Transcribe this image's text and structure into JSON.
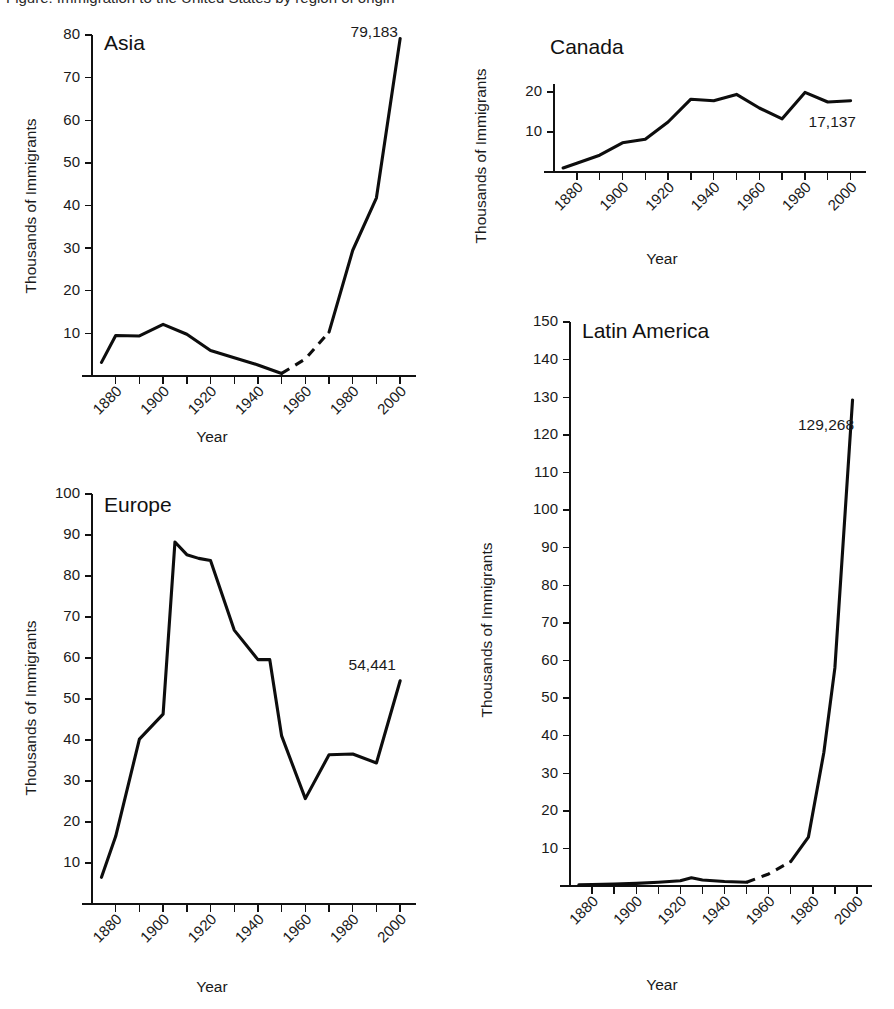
{
  "figure": {
    "background": "#ffffff",
    "line_color": "#0d0d0d",
    "axis_color": "#111111",
    "text_color": "#1a1a1a",
    "clipped_caption": "Figure: Immigration to the United States by region of origin"
  },
  "common": {
    "ylabel": "Thousands of Immigrants",
    "xlabel": "Year",
    "xtick_labels": [
      "1880",
      "1900",
      "1920",
      "1940",
      "1960",
      "1980",
      "2000"
    ]
  },
  "chart_data": [
    {
      "id": "asia",
      "type": "line",
      "title": "Asia",
      "xlabel": "Year",
      "ylabel": "Thousands of Immigrants",
      "xlim": [
        1870,
        2005
      ],
      "ylim": [
        0,
        80
      ],
      "yticks": [
        10,
        20,
        30,
        40,
        50,
        60,
        70,
        80
      ],
      "ytick_labels": [
        "10",
        "20",
        "30",
        "40",
        "50",
        "60",
        "70",
        "80"
      ],
      "xticks": [
        1880,
        1890,
        1900,
        1910,
        1920,
        1930,
        1940,
        1950,
        1960,
        1970,
        1980,
        1990,
        2000
      ],
      "xtick_labels": [
        "1880",
        "1900",
        "1920",
        "1940",
        "1960",
        "1980",
        "2000"
      ],
      "grid": false,
      "legend": "none",
      "endpoint_label": "79,183",
      "endpoint_year": 2000,
      "endpoint_value": 79.183,
      "solid_segments": [
        {
          "x": [
            1874,
            1880,
            1890,
            1900,
            1910,
            1920,
            1930,
            1940,
            1950
          ],
          "y": [
            3.2,
            9.5,
            9.4,
            12.1,
            9.8,
            6.0,
            4.3,
            2.6,
            0.6
          ]
        },
        {
          "x": [
            1970,
            1980,
            1990,
            2000
          ],
          "y": [
            10.3,
            29.5,
            41.8,
            79.183
          ]
        }
      ],
      "dashed_segments": [
        {
          "x": [
            1950,
            1960,
            1970
          ],
          "y": [
            0.6,
            4.0,
            10.3
          ]
        }
      ]
    },
    {
      "id": "canada",
      "type": "line",
      "title": "Canada",
      "xlabel": "Year",
      "ylabel": "Thousands of Immigrants",
      "xlim": [
        1870,
        2005
      ],
      "ylim": [
        0,
        22
      ],
      "yticks": [
        10,
        20
      ],
      "ytick_labels": [
        "10",
        "20"
      ],
      "xticks": [
        1880,
        1890,
        1900,
        1910,
        1920,
        1930,
        1940,
        1950,
        1960,
        1970,
        1980,
        1990,
        2000
      ],
      "xtick_labels": [
        "1880",
        "1900",
        "1920",
        "1940",
        "1960",
        "1980",
        "2000"
      ],
      "grid": false,
      "legend": "none",
      "endpoint_label": "17,137",
      "endpoint_year": 2000,
      "endpoint_value": 17.137,
      "solid_segments": [
        {
          "x": [
            1874,
            1880,
            1890,
            1900,
            1910,
            1920,
            1930,
            1940,
            1950,
            1960,
            1970,
            1980,
            1990,
            2000
          ],
          "y": [
            1.0,
            2.2,
            4.2,
            7.3,
            8.2,
            12.5,
            18.2,
            17.8,
            19.4,
            16.0,
            13.3,
            19.9,
            17.5,
            17.8
          ]
        }
      ],
      "dashed_segments": []
    },
    {
      "id": "europe",
      "type": "line",
      "title": "Europe",
      "xlabel": "Year",
      "ylabel": "Thousands of Immigrants",
      "xlim": [
        1870,
        2005
      ],
      "ylim": [
        0,
        100
      ],
      "yticks": [
        10,
        20,
        30,
        40,
        50,
        60,
        70,
        80,
        90,
        100
      ],
      "ytick_labels": [
        "10",
        "20",
        "30",
        "40",
        "50",
        "60",
        "70",
        "80",
        "90",
        "100"
      ],
      "xticks": [
        1880,
        1890,
        1900,
        1910,
        1920,
        1930,
        1940,
        1950,
        1960,
        1970,
        1980,
        1990,
        2000
      ],
      "xtick_labels": [
        "1880",
        "1900",
        "1920",
        "1940",
        "1960",
        "1980",
        "2000"
      ],
      "grid": false,
      "legend": "none",
      "endpoint_label": "54,441",
      "endpoint_year": 2000,
      "endpoint_value": 54.441,
      "solid_segments": [
        {
          "x": [
            1874,
            1880,
            1890,
            1900,
            1905,
            1910,
            1915,
            1920,
            1930,
            1940,
            1945,
            1950,
            1960,
            1970,
            1980,
            1990,
            2000
          ],
          "y": [
            6.5,
            16.5,
            40.2,
            46.3,
            88.3,
            85.2,
            84.3,
            83.8,
            66.8,
            59.6,
            59.6,
            41.0,
            25.7,
            36.4,
            36.6,
            34.4,
            54.441
          ]
        }
      ],
      "dashed_segments": []
    },
    {
      "id": "latin-america",
      "type": "line",
      "title": "Latin America",
      "xlabel": "Year",
      "ylabel": "Thousands of Immigrants",
      "xlim": [
        1870,
        2005
      ],
      "ylim": [
        0,
        150
      ],
      "yticks": [
        10,
        20,
        30,
        40,
        50,
        60,
        70,
        80,
        90,
        100,
        110,
        120,
        130,
        140,
        150
      ],
      "ytick_labels": [
        "10",
        "20",
        "30",
        "40",
        "50",
        "60",
        "70",
        "80",
        "90",
        "100",
        "110",
        "120",
        "130",
        "140",
        "150"
      ],
      "xticks": [
        1880,
        1890,
        1900,
        1910,
        1920,
        1930,
        1940,
        1950,
        1960,
        1970,
        1980,
        1990,
        2000
      ],
      "xtick_labels": [
        "1880",
        "1900",
        "1920",
        "1940",
        "1960",
        "1980",
        "2000"
      ],
      "grid": false,
      "legend": "none",
      "endpoint_label": "129,268",
      "endpoint_year": 1998,
      "endpoint_value": 129.268,
      "solid_segments": [
        {
          "x": [
            1874,
            1880,
            1890,
            1900,
            1910,
            1920,
            1925,
            1930,
            1940,
            1950
          ],
          "y": [
            0.3,
            0.4,
            0.5,
            0.7,
            1.0,
            1.4,
            2.2,
            1.6,
            1.2,
            1.0
          ]
        },
        {
          "x": [
            1970,
            1978,
            1985,
            1990,
            1998
          ],
          "y": [
            6.5,
            13.0,
            35.5,
            58.0,
            129.268
          ]
        }
      ],
      "dashed_segments": [
        {
          "x": [
            1950,
            1960,
            1970
          ],
          "y": [
            1.0,
            3.2,
            6.5
          ]
        }
      ]
    }
  ]
}
